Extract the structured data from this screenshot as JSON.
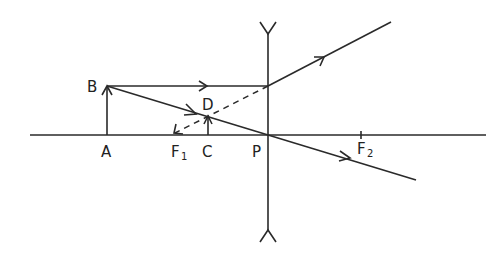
{
  "diagram": {
    "type": "ray-diagram-concave-lens",
    "labels": {
      "A": "A",
      "B": "B",
      "C": "C",
      "D": "D",
      "P": "P",
      "F1_main": "F",
      "F1_sub": "1",
      "F2_main": "F",
      "F2_sub": "2"
    },
    "colors": {
      "line": "#2a2a2a",
      "background": "#ffffff"
    }
  }
}
